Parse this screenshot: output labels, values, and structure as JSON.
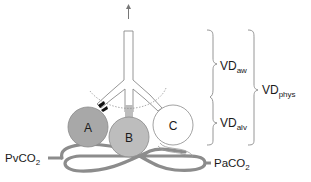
{
  "diagram": {
    "title": "",
    "alveoli": [
      {
        "id": "A",
        "label": "A",
        "fill": "#a8a8a8"
      },
      {
        "id": "B",
        "label": "B",
        "fill": "#bdbdbd"
      },
      {
        "id": "C",
        "label": "C",
        "fill": "#ffffff"
      }
    ],
    "blood": {
      "venous_label_main": "PvCO",
      "venous_label_sub": "2",
      "arterial_label_main": "PaCO",
      "arterial_label_sub": "2",
      "color": "#8c8c8c"
    },
    "dead_space": {
      "airway_main": "VD",
      "airway_sub": "aw",
      "alveolar_main": "VD",
      "alveolar_sub": "alv",
      "physiologic_main": "VD",
      "physiologic_sub": "phys"
    },
    "colors": {
      "line": "#8a8a8a",
      "text": "#1a1a1a",
      "occlusion": "#111111"
    }
  }
}
